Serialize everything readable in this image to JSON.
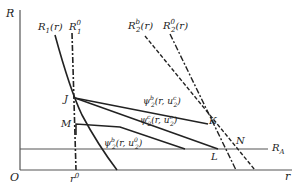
{
  "diagram": {
    "axes": {
      "y_label": "R",
      "x_label": "r",
      "origin_label": "O",
      "x_tick_label": "r",
      "x_tick_sup": "0"
    },
    "curves": {
      "R1": {
        "base": "R",
        "sub": "1",
        "arg": "(r)"
      },
      "R1_0": {
        "base": "R",
        "sub": "1",
        "sup": "0"
      },
      "R2b": {
        "base": "R",
        "sub": "2",
        "sup": "b",
        "arg": "(r)"
      },
      "R2_0": {
        "base": "R",
        "sub": "2",
        "sup": "0",
        "arg": "(r)"
      },
      "RA": {
        "base": "R",
        "sub": "A"
      }
    },
    "psi_lines": [
      {
        "base": "ψ",
        "sub": "2",
        "sup": "b",
        "arg_pre": "(r, u",
        "arg_sub": "2",
        "arg_sup": "c",
        "arg_post": ")"
      },
      {
        "base": "ψ",
        "sub": "2",
        "sup": "c",
        "arg_pre": "(r, u",
        "arg_sub": "2",
        "arg_sup": "c",
        "arg_post": ")"
      },
      {
        "base": "ψ",
        "sub": "2",
        "sup": "b",
        "arg_pre": "(r, u",
        "arg_sub": "2",
        "arg_sup": "0",
        "arg_post": ")"
      }
    ],
    "points": {
      "J": "J",
      "M": "M",
      "K": "K",
      "L": "L",
      "N": "N"
    },
    "colors": {
      "ink": "#222222",
      "axis": "#555555"
    }
  }
}
